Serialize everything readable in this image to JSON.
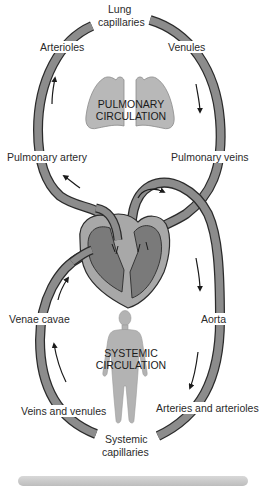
{
  "diagram": {
    "regions": {
      "pulmonary": "PULMONARY\nCIRCULATION",
      "pulmonary_line1": "PULMONARY",
      "pulmonary_line2": "CIRCULATION",
      "systemic_line1": "SYSTEMIC",
      "systemic_line2": "CIRCULATION"
    },
    "labels": {
      "lung_capillaries_1": "Lung",
      "lung_capillaries_2": "capillaries",
      "arterioles": "Arterioles",
      "venules": "Venules",
      "pulmonary_artery": "Pulmonary artery",
      "pulmonary_veins": "Pulmonary veins",
      "venae_cavae": "Venae cavae",
      "aorta": "Aorta",
      "veins_and_venules": "Veins and venules",
      "arteries_and_arterioles": "Arteries and arterioles",
      "systemic_capillaries_1": "Systemic",
      "systemic_capillaries_2": "capillaries"
    },
    "icons": [
      "lungs-icon",
      "heart-icon",
      "human-body-icon",
      "flow-arrow-icon"
    ],
    "colors": {
      "vessel_fill": "#8c8c8c",
      "vessel_stroke": "#2b2b2b",
      "heart_chamber": "#7a7a7a",
      "heart_wall": "#a8a8a8",
      "lungs": "#b5b5b5",
      "body": "#b0b0b0",
      "text": "#2a2a2a"
    }
  }
}
